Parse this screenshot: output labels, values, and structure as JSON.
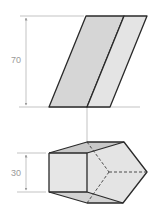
{
  "figure": {
    "type": "orthographic projection",
    "views": [
      "front view",
      "top view"
    ]
  },
  "front_view": {
    "dimension_height": {
      "label": "70"
    }
  },
  "top_view": {
    "dimension_depth": {
      "label": "30"
    }
  },
  "colors": {
    "face_light": "#e6e6e6",
    "face_mid": "#d4d4d4",
    "face_dark": "#c2c2c2",
    "edge": "#2a2a2a",
    "dimension": "#9a9a9a"
  }
}
